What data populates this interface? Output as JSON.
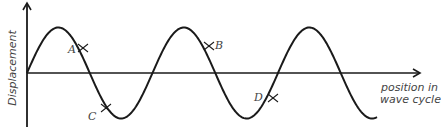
{
  "diagram": {
    "type": "wave",
    "axes": {
      "y_label": "Displacement",
      "x_label_line1": "position in",
      "x_label_line2": "wave cycle"
    },
    "points": [
      {
        "id": "A",
        "label": "A"
      },
      {
        "id": "B",
        "label": "B"
      },
      {
        "id": "C",
        "label": "C"
      },
      {
        "id": "D",
        "label": "D"
      }
    ],
    "colors": {
      "line": "#1a1a1a",
      "text": "#444444"
    }
  }
}
